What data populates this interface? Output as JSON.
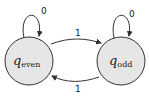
{
  "diagram": {
    "type": "finite-state-automaton",
    "states": [
      {
        "id": "q_even",
        "symbol": "q",
        "subscript": "even"
      },
      {
        "id": "q_odd",
        "symbol": "q",
        "subscript": "odd"
      }
    ],
    "transitions": [
      {
        "from": "q_even",
        "to": "q_even",
        "label": "0"
      },
      {
        "from": "q_odd",
        "to": "q_odd",
        "label": "0"
      },
      {
        "from": "q_even",
        "to": "q_odd",
        "label": "1"
      },
      {
        "from": "q_odd",
        "to": "q_even",
        "label": "1"
      }
    ],
    "colors": {
      "state_fill": "#e6e6e6",
      "stroke": "#333333"
    }
  }
}
